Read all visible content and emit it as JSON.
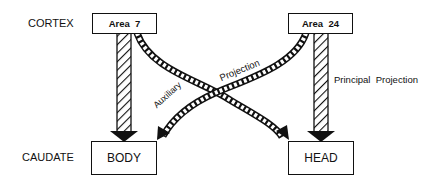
{
  "diagram": {
    "row_labels": {
      "cortex": "CORTEX",
      "caudate": "CAUDATE"
    },
    "nodes": {
      "area7": "Area  7",
      "area24": "Area  24",
      "body": "BODY",
      "head": "HEAD"
    },
    "edge_labels": {
      "principal": "Principal  Projection",
      "auxiliary": "Auxiliary",
      "projection": "Projection"
    },
    "edges": [
      {
        "from": "Area 7",
        "to": "BODY",
        "style": "hatched-straight",
        "type": "principal"
      },
      {
        "from": "Area 7",
        "to": "HEAD",
        "style": "chain-curved",
        "type": "auxiliary"
      },
      {
        "from": "Area 24",
        "to": "HEAD",
        "style": "hatched-straight",
        "type": "principal",
        "label": "Principal Projection"
      },
      {
        "from": "Area 24",
        "to": "BODY",
        "style": "chain-curved",
        "type": "auxiliary",
        "label": "Auxiliary Projection"
      }
    ]
  }
}
